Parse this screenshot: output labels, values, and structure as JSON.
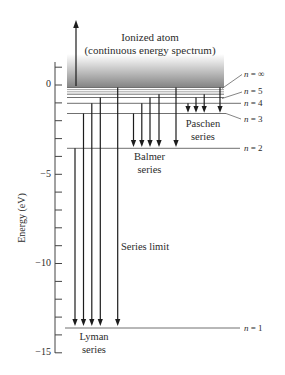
{
  "header": {
    "line1": "Ionized atom",
    "line2": "(continuous energy spectrum)"
  },
  "axis": {
    "label": "Energy (eV)",
    "ticks": [
      {
        "value": 0,
        "label": "0"
      },
      {
        "value": -5,
        "label": "−5"
      },
      {
        "value": -10,
        "label": "−10"
      },
      {
        "value": -15,
        "label": "−15"
      }
    ],
    "minor_tick_step_eV": 1,
    "range_eV": [
      -15,
      1
    ]
  },
  "levels": [
    {
      "n": "∞",
      "symbol": "n",
      "eq": " = ∞",
      "energy_eV": 0
    },
    {
      "n": "5",
      "symbol": "n",
      "eq": " = 5",
      "energy_eV": -0.54
    },
    {
      "n": "4",
      "symbol": "n",
      "eq": " = 4",
      "energy_eV": -0.85
    },
    {
      "n": "3",
      "symbol": "n",
      "eq": " = 3",
      "energy_eV": -1.51
    },
    {
      "n": "2",
      "symbol": "n",
      "eq": " = 2",
      "energy_eV": -3.4
    },
    {
      "n": "1",
      "symbol": "n",
      "eq": " = 1",
      "energy_eV": -13.6
    }
  ],
  "series": {
    "lyman": {
      "line1": "Lyman",
      "line2": "series",
      "final_n": 1,
      "initial_n": [
        "2",
        "3",
        "4",
        "5",
        "∞"
      ]
    },
    "balmer": {
      "line1": "Balmer",
      "line2": "series",
      "final_n": 2,
      "initial_n": [
        "3",
        "4",
        "5",
        "6",
        "∞"
      ]
    },
    "paschen": {
      "line1": "Paschen",
      "line2": "series",
      "final_n": 3,
      "initial_n": [
        "4",
        "5",
        "6",
        "∞"
      ]
    }
  },
  "annotations": {
    "series_limit": "Series limit",
    "ionization_arrow": "upward arrow into continuum"
  }
}
